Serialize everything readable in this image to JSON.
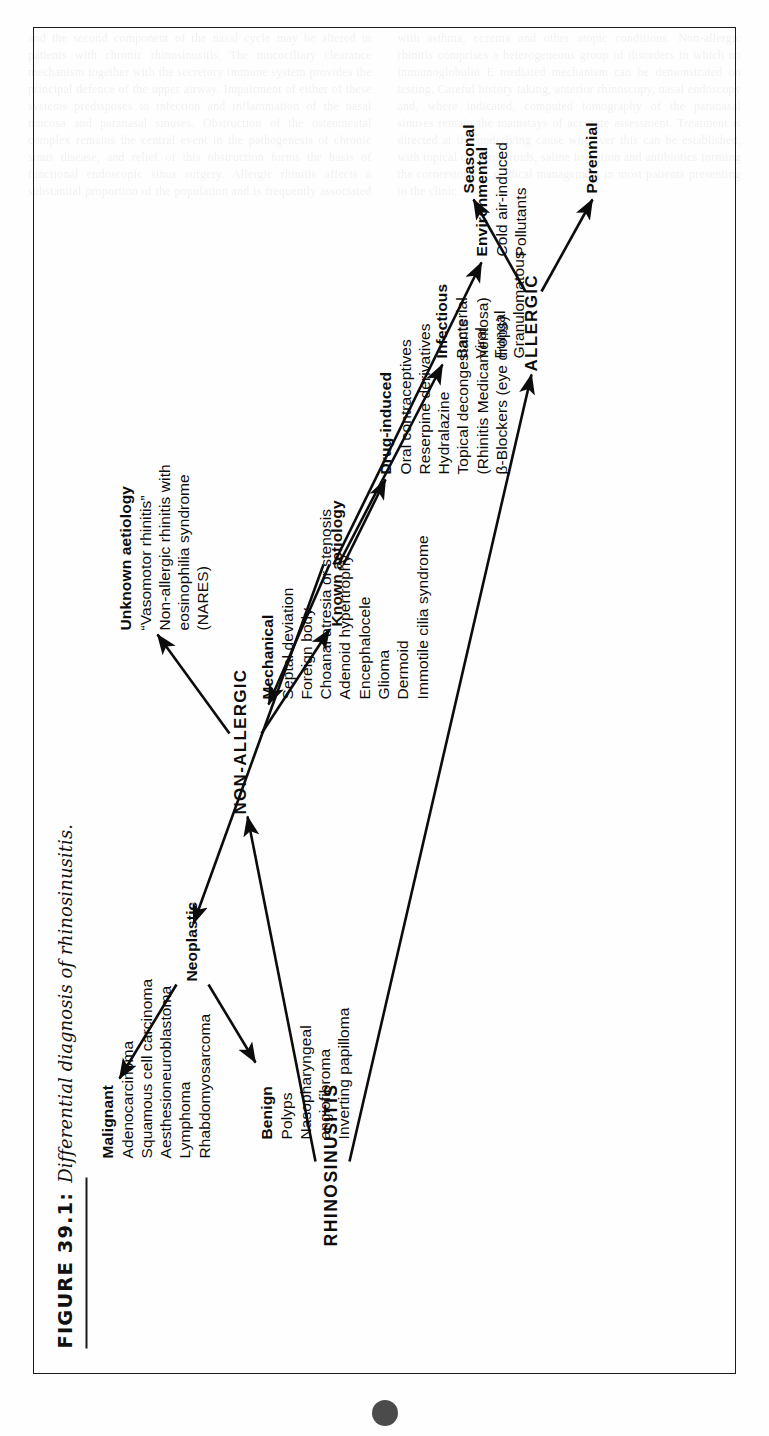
{
  "figure": {
    "caption_number": "FIGURE 39.1:",
    "caption_text": "Differential diagnosis of rhinosinusitis.",
    "page_marker": "",
    "ink_color": "#0c0c0c"
  },
  "diagram": {
    "root": {
      "label": "RHINOSINUSITIS"
    },
    "branches": {
      "allergic": {
        "label": "ALLERGIC"
      },
      "non_allergic": {
        "label": "NON-ALLERGIC"
      }
    },
    "allergic_children": [
      {
        "label": "Seasonal"
      },
      {
        "label": "Perennial"
      }
    ],
    "non_allergic_children": {
      "unknown": {
        "label": "Unknown aetiology",
        "items": [
          "“Vasomotor rhinitis”",
          "Non-allergic rhinitis with",
          "eosinophilia syndrome",
          "(NARES)"
        ]
      },
      "known": {
        "label": "Known aetiology"
      }
    },
    "known_children": [
      {
        "label": "Environmental",
        "items": [
          "Cold air-induced",
          "Pollutants"
        ]
      },
      {
        "label": "Infectious",
        "items": [
          "Bacterial",
          "Viral",
          "Fungal",
          "Granulomatous"
        ]
      },
      {
        "label": "Drug-induced",
        "items": [
          "Oral contraceptives",
          "Reserpine derivatives",
          "Hydralazine",
          "Topical decongestants",
          "(Rhinitis Medicamentosa)",
          "β-Blockers (eye drops)"
        ]
      },
      {
        "label": "Mechanical",
        "items": [
          "Septal deviation",
          "Foreign body",
          "Choanal atresia or stenosis",
          "Adenoid hypertrophy",
          "Encephalocele",
          "Glioma",
          "Dermoid",
          "Immotile cilia syndrome"
        ]
      },
      {
        "label": "Neoplastic",
        "items": []
      }
    ],
    "neoplastic_children": [
      {
        "label": "Benign",
        "items": [
          "Polyps",
          "Nasopharyngeal",
          "angiofibroma",
          "Inverting papilloma"
        ]
      },
      {
        "label": "Malignant",
        "items": [
          "Adenocarcinoma",
          "Squamous cell carcinoma",
          "Aesthesioneuroblastoma",
          "Lymphoma",
          "Rhabdomyosarcoma"
        ]
      }
    ]
  },
  "ghost_text": {
    "body": "and the second component of the nasal cycle may be altered in patients with chronic rhinosinusitis. The mucociliary clearance mechanism together with the secretory immune system provides the principal defence of the upper airway. Impairment of either of these systems predisposes to infection and inflammation of the nasal mucosa and paranasal sinuses. Obstruction of the osteomeatal complex remains the central event in the pathogenesis of chronic sinus disease, and relief of this obstruction forms the basis of functional endoscopic sinus surgery. Allergic rhinitis affects a substantial proportion of the population and is frequently associated with asthma, eczema and other atopic conditions. Non-allergic rhinitis comprises a heterogeneous group of disorders in which no immunoglobulin E mediated mechanism can be demonstrated on testing. Careful history taking, anterior rhinoscopy, nasal endoscopy and, where indicated, computed tomography of the paranasal sinuses remain the mainstays of accurate assessment. Treatment is directed at the underlying cause wherever this can be established, with topical corticosteroids, saline irrigation and antibiotics forming the cornerstone of medical management in most patients presenting to the clinic."
  }
}
